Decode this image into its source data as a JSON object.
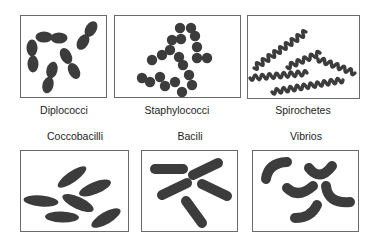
{
  "figure": {
    "panels": [
      {
        "label": "Diplococci",
        "shape": "paired cocci",
        "count": 5
      },
      {
        "label": "Staphylococci",
        "shape": "clustered cocci",
        "count": 21
      },
      {
        "label": "Spirochetes",
        "shape": "spiral",
        "count": 5
      },
      {
        "label": "Coccobacilli",
        "shape": "short ovoid rods",
        "count": 6
      },
      {
        "label": "Bacili",
        "shape": "rods",
        "count": 5
      },
      {
        "label": "Vibrios",
        "shape": "curved rods",
        "count": 5
      }
    ],
    "colors": {
      "cell_fill": "#3c3c3c",
      "box_stroke": "#6a6a6a",
      "background": "#ffffff"
    }
  }
}
